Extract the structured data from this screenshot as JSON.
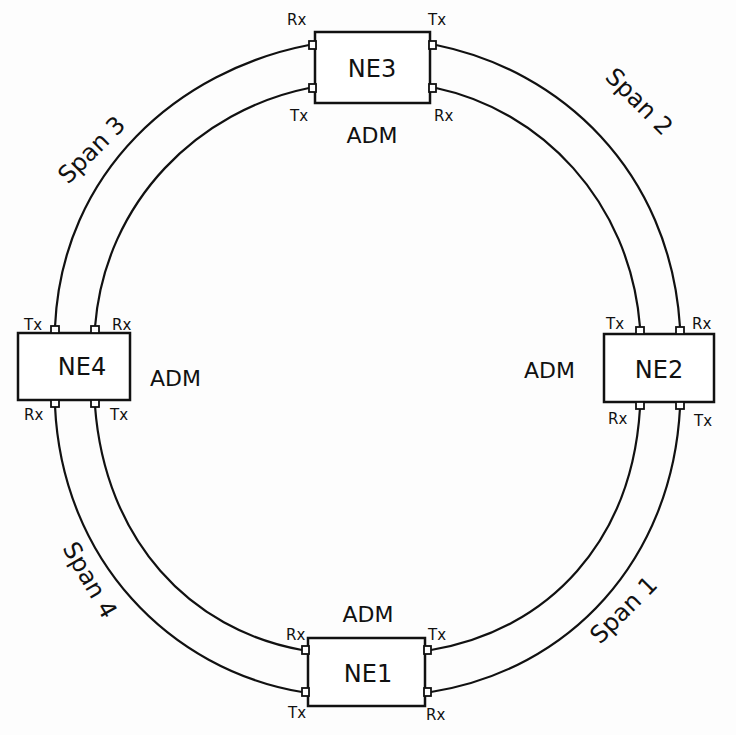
{
  "diagram": {
    "type": "SONET/SDH ring network",
    "nodes": [
      {
        "id": "NE1",
        "label": "NE1",
        "type_label": "ADM",
        "position": "bottom",
        "ports": {
          "top_left": "Rx",
          "bottom_left": "Tx",
          "top_right": "Tx",
          "bottom_right": "Rx"
        }
      },
      {
        "id": "NE2",
        "label": "NE2",
        "type_label": "ADM",
        "position": "right",
        "ports": {
          "top_left": "Tx",
          "top_right": "Rx",
          "bottom_left": "Rx",
          "bottom_right": "Tx"
        }
      },
      {
        "id": "NE3",
        "label": "NE3",
        "type_label": "ADM",
        "position": "top",
        "ports": {
          "top_left": "Rx",
          "bottom_left": "Tx",
          "top_right": "Tx",
          "bottom_right": "Rx"
        }
      },
      {
        "id": "NE4",
        "label": "NE4",
        "type_label": "ADM",
        "position": "left",
        "ports": {
          "top_left": "Tx",
          "top_right": "Rx",
          "bottom_left": "Rx",
          "bottom_right": "Tx"
        }
      }
    ],
    "spans": [
      {
        "label": "Span 1",
        "between": [
          "NE1",
          "NE2"
        ]
      },
      {
        "label": "Span 2",
        "between": [
          "NE2",
          "NE3"
        ]
      },
      {
        "label": "Span 3",
        "between": [
          "NE3",
          "NE4"
        ]
      },
      {
        "label": "Span 4",
        "between": [
          "NE4",
          "NE1"
        ]
      }
    ]
  }
}
